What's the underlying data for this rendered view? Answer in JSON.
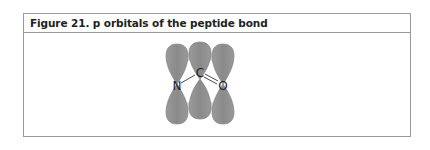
{
  "figure": {
    "title": "Figure 21. p orbitals of the peptide bond"
  },
  "diagram": {
    "atoms": [
      {
        "id": "N",
        "label": "N"
      },
      {
        "id": "C",
        "label": "C"
      },
      {
        "id": "O",
        "label": "O"
      }
    ],
    "bonds": [
      {
        "from": "N",
        "to": "C",
        "order": 1
      },
      {
        "from": "C",
        "to": "O",
        "order": 2
      }
    ],
    "orbital_color": "#8c8c8c",
    "overlap_color": "#d8d8d8"
  }
}
